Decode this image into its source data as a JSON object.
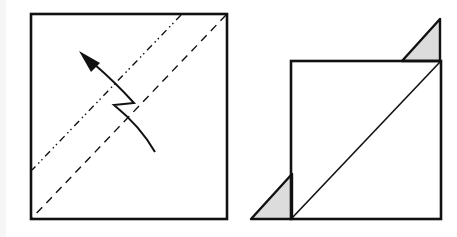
{
  "diagram": {
    "type": "origami-fold-steps",
    "colors": {
      "stroke": "#111111",
      "background": "#ffffff",
      "flap_fill": "#dcdcdc"
    },
    "steps": [
      {
        "name": "step-1-square",
        "square": {
          "x1": 31,
          "y1": 14,
          "x2": 227,
          "y2": 219
        },
        "lines": [
          {
            "kind": "mountain-fold",
            "style": "dash-dot-dot",
            "from": [
              181,
              14
            ],
            "to": [
              31,
              170
            ]
          },
          {
            "kind": "valley-fold",
            "style": "dashed",
            "from": [
              227,
              14
            ],
            "to": [
              31,
              219
            ]
          }
        ],
        "arrow": {
          "kind": "pleat-fold-arrow",
          "tip": [
            79,
            51
          ]
        }
      },
      {
        "name": "step-2-result",
        "square": {
          "x1": 291,
          "y1": 61,
          "x2": 441,
          "y2": 219
        },
        "diagonal": {
          "from": [
            291,
            219
          ],
          "to": [
            441,
            61
          ]
        },
        "flaps": [
          {
            "points": [
              [
                402,
                61
              ],
              [
                440,
                19
              ],
              [
                440,
                61
              ]
            ]
          },
          {
            "points": [
              [
                251,
                219
              ],
              [
                292,
                174
              ],
              [
                292,
                219
              ]
            ]
          }
        ]
      }
    ]
  }
}
